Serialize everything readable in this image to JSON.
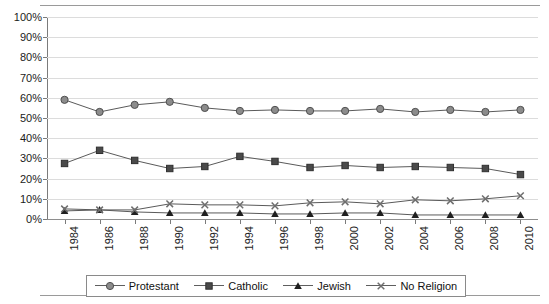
{
  "chart_data": {
    "type": "line",
    "title": "",
    "xlabel": "",
    "ylabel": "",
    "ylim": [
      0,
      100
    ],
    "ytick_labels": [
      "0%",
      "10%",
      "20%",
      "30%",
      "40%",
      "50%",
      "60%",
      "70%",
      "80%",
      "90%",
      "100%"
    ],
    "ytick_values": [
      0,
      10,
      20,
      30,
      40,
      50,
      60,
      70,
      80,
      90,
      100
    ],
    "grid": true,
    "legend_position": "bottom",
    "categories": [
      "1984",
      "1986",
      "1988",
      "1990",
      "1992",
      "1994",
      "1996",
      "1998",
      "2000",
      "2002",
      "2004",
      "2006",
      "2008",
      "2010"
    ],
    "series": [
      {
        "name": "Protestant",
        "marker": "circle",
        "color": "#8c8c8c",
        "values": [
          59,
          53,
          56.5,
          58,
          55,
          53.5,
          54,
          53.5,
          53.5,
          54.5,
          53,
          54,
          53,
          54
        ]
      },
      {
        "name": "Catholic",
        "marker": "square",
        "color": "#4a4a4a",
        "values": [
          27.5,
          34,
          29,
          25,
          26,
          31,
          28.5,
          25.5,
          26.5,
          25.5,
          26,
          25.5,
          25,
          22
        ]
      },
      {
        "name": "Jewish",
        "marker": "triangle",
        "color": "#1f1f1f",
        "values": [
          4,
          4.5,
          3.5,
          3,
          3,
          3,
          2.5,
          2.5,
          3,
          3,
          2,
          2,
          2,
          2
        ]
      },
      {
        "name": "No Religion",
        "marker": "x",
        "color": "#6e6e6e",
        "values": [
          5,
          4.5,
          4.5,
          7.5,
          7,
          7,
          6.5,
          8,
          8.5,
          7.5,
          9.5,
          9,
          10,
          11.5
        ]
      }
    ]
  },
  "legend": {
    "items": [
      {
        "label": "Protestant",
        "marker": "circle"
      },
      {
        "label": "Catholic",
        "marker": "square"
      },
      {
        "label": "Jewish",
        "marker": "triangle"
      },
      {
        "label": "No Religion",
        "marker": "x"
      }
    ]
  }
}
